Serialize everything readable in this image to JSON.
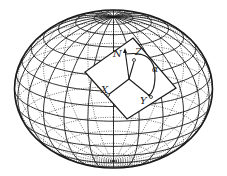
{
  "figure": {
    "colors": {
      "ink": "#1a1a1a",
      "background": "#ffffff"
    },
    "labels": {
      "north": "N",
      "zenith": "Z",
      "azimuth": "α",
      "x_axis": "X",
      "y_axis": "Y"
    },
    "graticule": {
      "meridians": 24,
      "parallels": 16
    }
  }
}
